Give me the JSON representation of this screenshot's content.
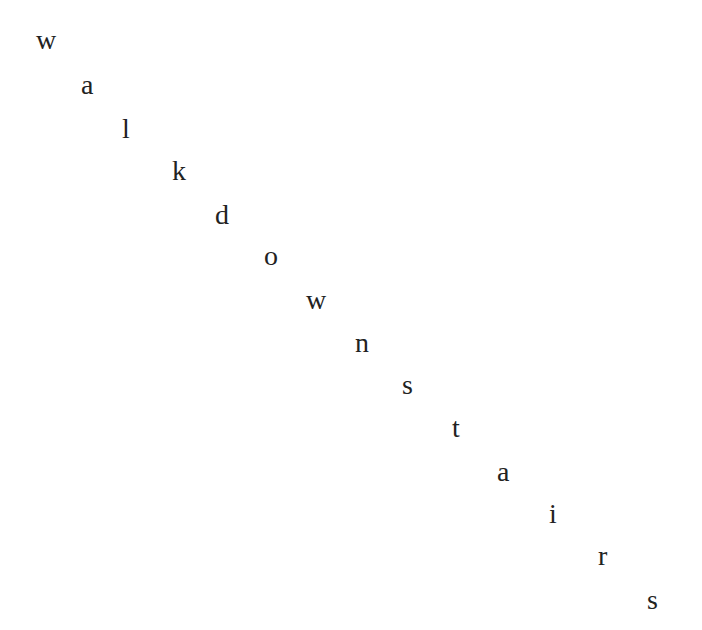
{
  "phrase": "walk downstairs",
  "text_color": "#222222",
  "background_color": "#ffffff",
  "letters": [
    {
      "char": "w",
      "x": 36,
      "baseline": 47
    },
    {
      "char": "a",
      "x": 81,
      "baseline": 92
    },
    {
      "char": "l",
      "x": 122,
      "baseline": 136
    },
    {
      "char": "k",
      "x": 172,
      "baseline": 178
    },
    {
      "char": "d",
      "x": 215,
      "baseline": 222
    },
    {
      "char": "o",
      "x": 264,
      "baseline": 263
    },
    {
      "char": "w",
      "x": 306,
      "baseline": 307
    },
    {
      "char": "n",
      "x": 355,
      "baseline": 350
    },
    {
      "char": "s",
      "x": 402,
      "baseline": 392
    },
    {
      "char": "t",
      "x": 452,
      "baseline": 435
    },
    {
      "char": "a",
      "x": 497,
      "baseline": 479
    },
    {
      "char": "i",
      "x": 549,
      "baseline": 521
    },
    {
      "char": "r",
      "x": 598,
      "baseline": 563
    },
    {
      "char": "s",
      "x": 647,
      "baseline": 607
    }
  ]
}
